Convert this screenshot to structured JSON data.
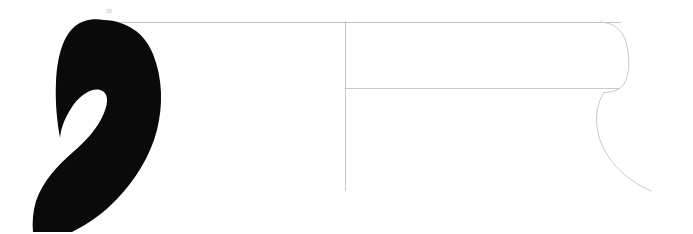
{
  "figure": {
    "kind": "archaeological-profile-illustration",
    "background_color": "#ffffff",
    "width": 693,
    "height": 234
  },
  "annotations": {
    "scale_label": "38",
    "scale_label_color": "#b9b9b9"
  },
  "drawing": {
    "section_fill_color": "#0a0a0a",
    "outline_color": "#c9c9c9",
    "axis_color": "#c4c4c4",
    "rim_line_color": "#bdbdbd",
    "section_name": "handle-section-silhouette",
    "profile_name": "rim-profile-outline",
    "axis_name": "vertical-centre-axis",
    "rim_line_name": "rim-horizontal-line",
    "wall_line_name": "interior-wall-line"
  },
  "chart_data": {
    "type": "line",
    "xlabel": "",
    "ylabel": "",
    "xlim": [
      0,
      693
    ],
    "ylim": [
      0,
      234
    ],
    "grid": false,
    "legend": "none",
    "annotations": [
      {
        "text": "38",
        "x": 108,
        "y": 12
      }
    ],
    "series": [
      {
        "name": "rim-horizontal-line",
        "type": "line",
        "x": [
          108,
          620
        ],
        "y": [
          22,
          22
        ]
      },
      {
        "name": "interior-wall-line",
        "type": "line",
        "x": [
          345,
          620
        ],
        "y": [
          88,
          88
        ]
      },
      {
        "name": "vertical-centre-axis",
        "type": "line",
        "x": [
          345,
          345
        ],
        "y": [
          22,
          190
        ]
      },
      {
        "name": "rim-profile-outline",
        "type": "line",
        "x": [
          600,
          615,
          625,
          628,
          624,
          615,
          605
        ],
        "y": [
          22,
          26,
          42,
          64,
          82,
          90,
          92
        ]
      },
      {
        "name": "body-profile-curve",
        "type": "line",
        "x": [
          605,
          597,
          600,
          612,
          630,
          650
        ],
        "y": [
          92,
          110,
          135,
          160,
          178,
          190
        ]
      },
      {
        "name": "handle-section-silhouette",
        "type": "area",
        "x": [
          100,
          140,
          158,
          160,
          150,
          120,
          80,
          55,
          40,
          35,
          60,
          95,
          115,
          130,
          148,
          155,
          140,
          110,
          82,
          68,
          62,
          70,
          88
        ],
        "y": [
          20,
          40,
          80,
          120,
          155,
          185,
          210,
          228,
          232,
          205,
          180,
          155,
          130,
          105,
          75,
          45,
          28,
          22,
          30,
          52,
          78,
          96,
          100
        ]
      }
    ]
  }
}
